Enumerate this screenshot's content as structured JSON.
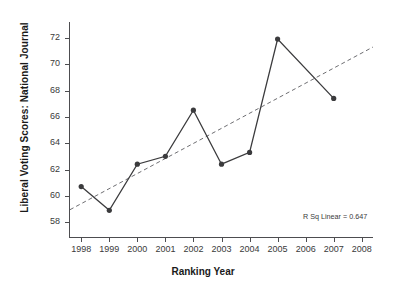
{
  "chart_data": {
    "type": "line",
    "title": "",
    "xlabel": "Ranking Year",
    "ylabel": "Liberal Voting Scores: National Journal",
    "x": [
      1998,
      1999,
      2000,
      2001,
      2002,
      2003,
      2004,
      2005,
      2007
    ],
    "values": [
      60.7,
      58.9,
      62.4,
      63.0,
      66.5,
      62.4,
      63.3,
      71.9,
      67.4
    ],
    "series": [
      {
        "name": "Liberal Voting Scores: National Journal",
        "x": [
          1998,
          1999,
          2000,
          2001,
          2002,
          2003,
          2004,
          2005,
          2007
        ],
        "values": [
          60.7,
          58.9,
          62.4,
          63.0,
          66.5,
          62.4,
          63.3,
          71.9,
          67.4
        ],
        "marker": "filled-circle",
        "color": "#3b3b3d"
      },
      {
        "name": "linear-fit",
        "style": "dashed",
        "color": "#6e6e72",
        "x": [
          1997.6,
          2008.4
        ],
        "values": [
          58.95,
          71.3
        ]
      }
    ],
    "xticks": [
      1998,
      1999,
      2000,
      2001,
      2002,
      2003,
      2004,
      2005,
      2006,
      2007,
      2008
    ],
    "xticklabels": [
      "1998",
      "1999",
      "2000",
      "2001",
      "2002",
      "2003",
      "2004",
      "2005",
      "2006",
      "2007",
      "2008"
    ],
    "yticks": [
      58,
      60,
      62,
      64,
      66,
      68,
      70,
      72
    ],
    "yticklabels": [
      "58",
      "60",
      "62",
      "64",
      "66",
      "68",
      "70",
      "72"
    ],
    "xlim": [
      1997.6,
      2008.4
    ],
    "ylim": [
      56.8,
      73.2
    ],
    "grid": false,
    "legend": false,
    "annotations": [
      {
        "name": "r-squared",
        "text": "R Sq Linear = 0.647"
      }
    ]
  },
  "axis": {
    "y_title": "Liberal Voting Scores: National Journal",
    "x_title": "Ranking Year"
  },
  "annotation": {
    "r_squared": "R Sq Linear = 0.647"
  },
  "colors": {
    "series": "#3b3b3d",
    "fit": "#6e6e72",
    "axis": "#4d4d50",
    "text": "#1a1a1a"
  }
}
